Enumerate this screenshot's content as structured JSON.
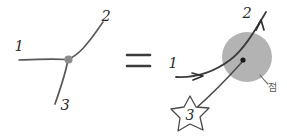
{
  "figure": {
    "background_color": "#ffffff",
    "ink_color": "#4a4a4a",
    "dark_ink_color": "#2b2b2b",
    "disk_color": "#b3b3b3",
    "node_color": "#8c8c8c",
    "relation_symbol": "="
  },
  "left_diagram": {
    "name": "trivalent-vertex",
    "node": {
      "name": "vertex-dot",
      "color": "#8c8c8c"
    },
    "edges": [
      {
        "id": "edge-1",
        "label": "1"
      },
      {
        "id": "edge-2",
        "label": "2"
      },
      {
        "id": "edge-3",
        "label": "3"
      }
    ]
  },
  "right_diagram": {
    "name": "curve-through-disk",
    "disk": {
      "name": "gray-disk",
      "color": "#b3b3b3",
      "label": "점"
    },
    "marked_point": {
      "name": "interior-point",
      "color": "#1a1a1a"
    },
    "strand": {
      "start_label": "1",
      "end_label": "2",
      "arrow_count": 2
    },
    "star": {
      "name": "star-marker",
      "label": "3"
    }
  },
  "labels": {
    "left_1": "1",
    "left_2": "2",
    "left_3": "3",
    "equals": "=",
    "right_1": "1",
    "right_2": "2",
    "star_3": "3",
    "disk_annotation": "점"
  }
}
